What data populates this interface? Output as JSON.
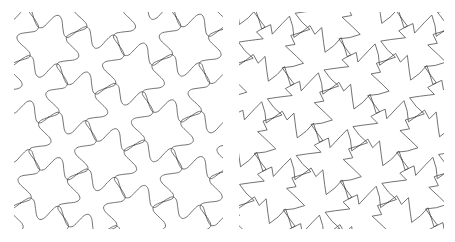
{
  "figure": {
    "background_color": "#ffffff",
    "width": 455,
    "height": 242
  },
  "style": {
    "stroke_color": "#4a4a4a",
    "stroke_width": 0.7,
    "fill": "none"
  },
  "panels": [
    {
      "id": "left",
      "name": "curved-pinwheel-tessellation",
      "caption": "",
      "edge_style": "curved",
      "symmetry": "p4",
      "lattice": "square",
      "cell_size": 45,
      "motif": "four-armed pinwheel with wavy edges",
      "rotation_deg": 18,
      "origin_x": 14,
      "origin_y": 12,
      "width": 209,
      "height": 217,
      "cols": 6,
      "rows": 6
    },
    {
      "id": "right",
      "name": "angular-pinwheel-tessellation",
      "caption": "",
      "edge_style": "angular",
      "symmetry": "p4",
      "lattice": "square",
      "cell_size": 45,
      "motif": "four-armed pinwheel with zigzag straight edges",
      "rotation_deg": 18,
      "origin_x": 239,
      "origin_y": 12,
      "width": 205,
      "height": 217,
      "cols": 6,
      "rows": 6
    }
  ],
  "chart_data": {
    "type": "line",
    "title": "",
    "xlabel": "",
    "ylabel": "",
    "series": [
      {
        "name": "curved-tiling",
        "edge_profile": [
          0,
          0.22,
          -0.22,
          0.18,
          -0.18,
          0
        ],
        "cell_size": 45,
        "rotation_deg": 18
      },
      {
        "name": "angular-tiling",
        "edge_profile": [
          0,
          0.26,
          -0.26,
          0.22,
          -0.22,
          0
        ],
        "cell_size": 45,
        "rotation_deg": 18
      }
    ]
  }
}
